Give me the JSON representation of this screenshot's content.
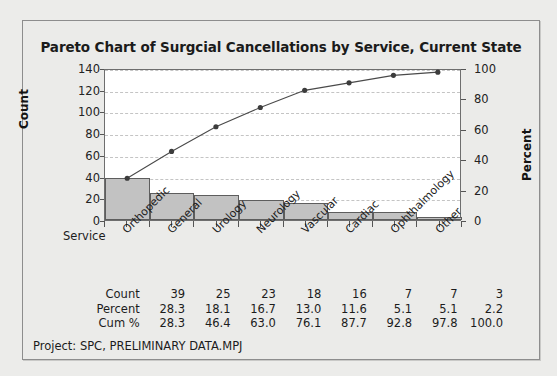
{
  "chart_data": {
    "type": "bar",
    "title": "Pareto Chart of Surgcial Cancellations by Service, Current State",
    "categories": [
      "Orthopedic",
      "General",
      "Urology",
      "Neurology",
      "Vascular",
      "Cardiac",
      "Ophthalmology",
      "Other"
    ],
    "values": [
      39,
      25,
      23,
      18,
      16,
      7,
      7,
      3
    ],
    "series": [
      {
        "name": "Count",
        "values": [
          39,
          25,
          23,
          18,
          16,
          7,
          7,
          3
        ]
      },
      {
        "name": "Percent",
        "values": [
          28.3,
          18.1,
          16.7,
          13.0,
          11.6,
          5.1,
          5.1,
          2.2
        ]
      },
      {
        "name": "Cum %",
        "values": [
          28.3,
          46.4,
          63.0,
          76.1,
          87.7,
          92.8,
          97.8,
          100.0
        ]
      }
    ],
    "cumulative_counts": [
      39,
      64,
      87,
      105,
      121,
      128,
      135,
      138
    ],
    "total_count": 138,
    "xlabel": "Service",
    "ylabel": "Count",
    "y2label": "Percent",
    "ylim": [
      0,
      140
    ],
    "y2lim": [
      0,
      100
    ],
    "yticks": [
      0,
      20,
      40,
      60,
      80,
      100,
      120,
      140
    ],
    "y2ticks": [
      0,
      20,
      40,
      60,
      80,
      100
    ],
    "grid": true,
    "legend": "none",
    "bar_color": "#c2c2c2",
    "bar_border_color": "#5d5d5d",
    "line_color": "#4a4a4a",
    "marker_color": "#3c3c3c",
    "gridline_color": "#c4c4c4"
  },
  "table": {
    "rows": [
      {
        "label": "Count",
        "cells": [
          "39",
          "25",
          "23",
          "18",
          "16",
          "7",
          "7",
          "3"
        ]
      },
      {
        "label": "Percent",
        "cells": [
          "28.3",
          "18.1",
          "16.7",
          "13.0",
          "11.6",
          "5.1",
          "5.1",
          "2.2"
        ]
      },
      {
        "label": "Cum %",
        "cells": [
          "28.3",
          "46.4",
          "63.0",
          "76.1",
          "87.7",
          "92.8",
          "97.8",
          "100.0"
        ]
      }
    ]
  },
  "footer": {
    "note": "Project: SPC, PRELIMINARY DATA.MPJ"
  }
}
